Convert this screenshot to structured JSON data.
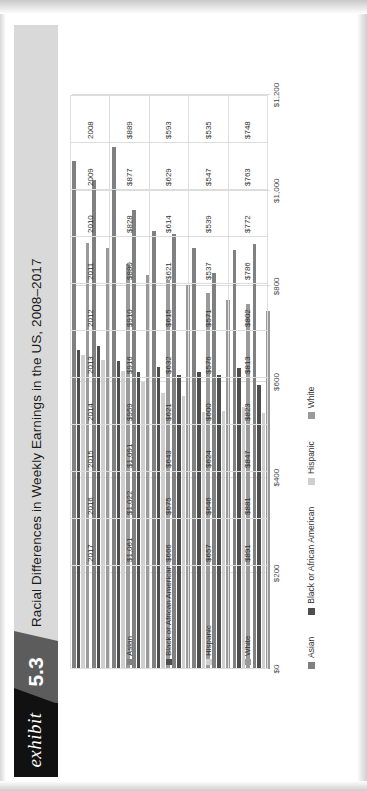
{
  "exhibit": {
    "word": "exhibit",
    "number": "5.3",
    "title": "Racial Differences in Weekly Earnings in the US, 2008–2017"
  },
  "colors": {
    "asian": "#808080",
    "black": "#4d4d4d",
    "hispanic": "#cfcfcf",
    "white": "#9a9a9a",
    "banner_dark": "#111111",
    "banner_mid": "#5c5c5c",
    "banner_light": "#d9d9d9"
  },
  "legend": {
    "items": [
      {
        "label": "Asian",
        "color": "#808080"
      },
      {
        "label": "Black or African American",
        "color": "#4d4d4d"
      },
      {
        "label": "Hispanic",
        "color": "#cfcfcf"
      },
      {
        "label": "White",
        "color": "#9a9a9a"
      }
    ]
  },
  "axis": {
    "ticks": [
      "$0",
      "$200",
      "$400",
      "$600",
      "$800",
      "$1,000",
      "$1,200"
    ]
  },
  "table": {
    "row_labels": [
      "Asian",
      "Black or African American",
      "Hispanic",
      "White"
    ],
    "years": [
      "2008",
      "2009",
      "2010",
      "2011",
      "2012",
      "2013",
      "2014",
      "2015",
      "2016",
      "2017"
    ],
    "rows": [
      [
        "$889",
        "$877",
        "$828",
        "$880",
        "$910",
        "$916",
        "$959",
        "$1,091",
        "$1,022",
        "$1,061"
      ],
      [
        "$593",
        "$629",
        "$614",
        "$621",
        "$615",
        "$632",
        "$621",
        "$643",
        "$675",
        "$666"
      ],
      [
        "$535",
        "$547",
        "$539",
        "$537",
        "$571",
        "$576",
        "$600",
        "$624",
        "$646",
        "$657"
      ],
      [
        "$748",
        "$763",
        "$772",
        "$786",
        "$802",
        "$813",
        "$823",
        "$847",
        "$881",
        "$891"
      ]
    ]
  },
  "chart_data": {
    "type": "bar",
    "title": "Racial Differences in Weekly Earnings in the US, 2008–2017",
    "orientation": "horizontal",
    "xlabel": "",
    "ylabel": "",
    "xlim": [
      0,
      1200
    ],
    "grid": true,
    "legend_position": "bottom",
    "tick_labels": [
      "$0",
      "$200",
      "$400",
      "$600",
      "$800",
      "$1,000",
      "$1,200"
    ],
    "categories": [
      "2008",
      "2009",
      "2010",
      "2011",
      "2012",
      "2013",
      "2014",
      "2015",
      "2016",
      "2017"
    ],
    "series": [
      {
        "name": "Asian",
        "color": "#808080",
        "values": [
          889,
          877,
          828,
          880,
          910,
          916,
          959,
          1091,
          1022,
          1061
        ]
      },
      {
        "name": "Black or African American",
        "color": "#4d4d4d",
        "values": [
          593,
          629,
          614,
          621,
          615,
          632,
          621,
          643,
          675,
          666
        ]
      },
      {
        "name": "Hispanic",
        "color": "#cfcfcf",
        "values": [
          535,
          547,
          539,
          537,
          571,
          576,
          600,
          624,
          646,
          657
        ]
      },
      {
        "name": "White",
        "color": "#9a9a9a",
        "values": [
          748,
          763,
          772,
          786,
          802,
          813,
          823,
          847,
          881,
          891
        ]
      }
    ]
  }
}
